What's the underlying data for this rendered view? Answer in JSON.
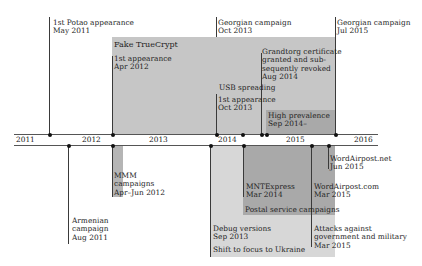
{
  "colors": {
    "box_light": "#d7d7d7",
    "box_mid": "#c6c6c6",
    "box_dark": "#a9a9a9",
    "axis": "#555555",
    "marker": "#111111"
  },
  "axis": {
    "years": [
      "2011",
      "2012",
      "2013",
      "2014",
      "2015",
      "2016"
    ]
  },
  "upper_events": {
    "potao": {
      "line1": "1st Potao appearance",
      "line2": "May 2011"
    },
    "georgian_2013": {
      "line1": "Georgian campaign",
      "line2": "Oct 2013"
    },
    "georgian_2015": {
      "line1": "Georgian campaign",
      "line2": "Jul 2015"
    },
    "fake_truecrypt": {
      "title": "Fake TrueCrypt",
      "line1": "1st appearance",
      "line2": "Apr 2012"
    },
    "grandtorg": {
      "line1": "Grandtorg certificate",
      "line2": "granted and sub-",
      "line3": "sequently revoked",
      "line4": "Aug 2014"
    },
    "usb": {
      "title": "USB spreading",
      "line1": "1st appearance",
      "line2": "Oct 2013"
    },
    "high_prevalence": {
      "line1": "High prevalence",
      "line2": "Sep 2014–"
    }
  },
  "lower_events": {
    "armenian": {
      "line1": "Armenian",
      "line2": "campaign",
      "line3": "Aug 2011"
    },
    "mmm": {
      "line1": "MMM",
      "line2": "campaigns",
      "line3": "Apr–Jun 2012"
    },
    "mntexpress": {
      "line1": "MNTExpress",
      "line2": "Mar 2014"
    },
    "wordairpost_com": {
      "line1": "WordAirpost.com",
      "line2": "Mar 2015"
    },
    "wordairpost_net": {
      "line1": "WordAirpost.net",
      "line2": "Jun 2015"
    },
    "postal": {
      "title": "Postal service campaigns"
    },
    "debug": {
      "line1": "Debug versions",
      "line2": "Sep 2013"
    },
    "ukraine": {
      "title": "Shift to focus to Ukraine"
    },
    "attacks": {
      "line1": "Attacks against",
      "line2": "government and military",
      "line3": "Mar 2015"
    }
  }
}
